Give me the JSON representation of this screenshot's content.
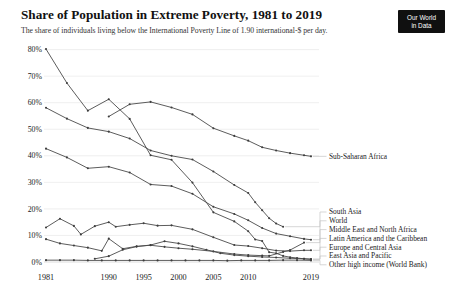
{
  "header": {
    "logo": {
      "line1": "Our World",
      "line2": "in Data",
      "bg_color": "#101010",
      "text_color": "#ffffff"
    }
  },
  "chart_data": {
    "type": "line",
    "title": "Share of Population in Extreme Poverty, 1981 to 2019",
    "subtitle": "The share of individuals living below the International Poverty Line of 1.90 international-$ per day.",
    "x_axis": {
      "ticks": [
        1981,
        1990,
        1995,
        2000,
        2005,
        2010,
        2019
      ],
      "range": [
        1981,
        2019
      ]
    },
    "y_axis": {
      "ticks": [
        "0%",
        "10%",
        "20%",
        "30%",
        "40%",
        "50%",
        "60%",
        "70%",
        "80%"
      ],
      "range": [
        0,
        80
      ],
      "unit": "%"
    },
    "grid": true,
    "legend_position": "right-edge-line-labels",
    "styles": {
      "line_color": "#4a4a4a",
      "marker_color": "#3d3d3d",
      "grid_color": "#e8e8e8",
      "zero_line_color": "#cfcfcf",
      "connector_color": "#c4c4c4",
      "text_color": "#1a1a1a",
      "marker": "dot"
    },
    "legend_order": [
      "Sub-Saharan Africa",
      "South Asia",
      "World",
      "Middle East and North Africa",
      "Latin America and the Caribbean",
      "Europe and Central Asia",
      "East Asia and Pacific",
      "Other high income (World Bank)"
    ],
    "series": [
      {
        "name": "Sub-Saharan Africa",
        "x": [
          1990,
          1993,
          1996,
          1999,
          2002,
          2005,
          2008,
          2010,
          2012,
          2014,
          2016,
          2018,
          2019
        ],
        "y": [
          54.8,
          59.4,
          60.3,
          58.2,
          55.6,
          50.4,
          47.5,
          45.7,
          43.2,
          42.0,
          41.0,
          40.2,
          39.8
        ]
      },
      {
        "name": "South Asia",
        "x": [
          1981,
          1984,
          1987,
          1990,
          1993,
          1996,
          1999,
          2002,
          2005,
          2008,
          2010,
          2011,
          2012,
          2013,
          2014,
          2015
        ],
        "y": [
          58.1,
          54.0,
          50.5,
          49.1,
          46.5,
          42.0,
          40.0,
          38.6,
          34.1,
          29.0,
          26.0,
          22.5,
          19.5,
          16.5,
          14.5,
          13.3
        ]
      },
      {
        "name": "World",
        "x": [
          1981,
          1984,
          1987,
          1990,
          1993,
          1996,
          1999,
          2002,
          2005,
          2008,
          2010,
          2012,
          2014,
          2016,
          2018,
          2019
        ],
        "y": [
          42.7,
          39.4,
          35.3,
          35.9,
          33.7,
          29.2,
          28.6,
          25.7,
          20.8,
          18.1,
          15.7,
          12.8,
          10.7,
          9.7,
          8.7,
          8.4
        ]
      },
      {
        "name": "Middle East and North Africa",
        "x": [
          1981,
          1983,
          1985,
          1987,
          1989,
          1990,
          1992,
          1994,
          1996,
          1998,
          2000,
          2002,
          2005,
          2008,
          2010,
          2012,
          2013,
          2015,
          2016,
          2018
        ],
        "y": [
          8.6,
          7.0,
          6.2,
          5.4,
          4.2,
          8.8,
          5.0,
          5.9,
          6.3,
          5.7,
          5.2,
          4.8,
          4.0,
          3.0,
          2.6,
          2.4,
          2.3,
          3.8,
          4.5,
          7.3
        ]
      },
      {
        "name": "Latin America and the Caribbean",
        "x": [
          1981,
          1983,
          1985,
          1986,
          1988,
          1990,
          1991,
          1993,
          1995,
          1997,
          1999,
          2002,
          2005,
          2008,
          2010,
          2012,
          2014,
          2016,
          2018,
          2019
        ],
        "y": [
          13.0,
          16.3,
          13.6,
          10.4,
          13.5,
          15.0,
          13.3,
          14.0,
          14.6,
          13.7,
          13.8,
          12.3,
          9.3,
          6.4,
          6.0,
          5.2,
          4.3,
          4.1,
          4.4,
          4.4
        ]
      },
      {
        "name": "Europe and Central Asia",
        "x": [
          1988,
          1990,
          1992,
          1994,
          1996,
          1998,
          2000,
          2002,
          2004,
          2006,
          2008,
          2010,
          2012,
          2014,
          2016,
          2018,
          2019
        ],
        "y": [
          1.2,
          2.2,
          4.6,
          5.8,
          6.4,
          7.8,
          7.0,
          5.9,
          4.6,
          3.3,
          2.6,
          2.2,
          1.9,
          1.7,
          1.4,
          1.2,
          1.1
        ]
      },
      {
        "name": "East Asia and Pacific",
        "x": [
          1981,
          1984,
          1987,
          1990,
          1993,
          1996,
          1999,
          2002,
          2005,
          2008,
          2010,
          2011,
          2012,
          2013,
          2014,
          2015,
          2016,
          2017,
          2018,
          2019
        ],
        "y": [
          80.2,
          67.4,
          57.0,
          61.3,
          53.9,
          40.2,
          38.5,
          29.9,
          18.7,
          15.3,
          11.6,
          8.5,
          7.9,
          3.7,
          3.3,
          2.3,
          1.8,
          1.5,
          1.2,
          1.0
        ]
      },
      {
        "name": "Other high income (World Bank)",
        "x": [
          1981,
          1983,
          1985,
          1987,
          1989,
          1991,
          1993,
          1995,
          1997,
          1999,
          2001,
          2003,
          2005,
          2007,
          2009,
          2011,
          2013,
          2015,
          2017,
          2019
        ],
        "y": [
          0.7,
          0.7,
          0.7,
          0.6,
          0.6,
          0.6,
          0.6,
          0.6,
          0.6,
          0.6,
          0.6,
          0.6,
          0.6,
          0.5,
          0.6,
          0.6,
          0.6,
          0.7,
          0.7,
          0.6
        ]
      }
    ]
  }
}
